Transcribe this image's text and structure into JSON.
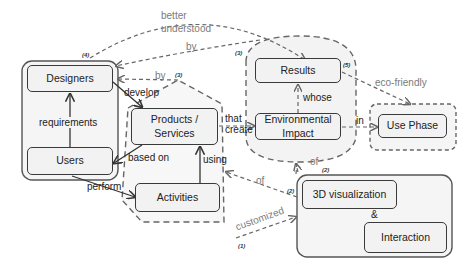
{
  "nodes": {
    "designers": "Designers",
    "users": "Users",
    "products": "Products / Services",
    "activities": "Activities",
    "results": "Results",
    "environmental_impact": "Environmental Impact",
    "use_phase": "Use Phase",
    "visualization": "3D visualization",
    "interaction": "Interaction",
    "ampersand": "&"
  },
  "edges": {
    "requirements": "requirements",
    "develop": "develop",
    "based_on": "based on",
    "perform": "perform",
    "using": "using",
    "that": "that",
    "create": "create",
    "whose": "whose",
    "in": "in",
    "eco_friendly": "eco-friendly",
    "better": "better",
    "understood": "understood",
    "by_top": "by",
    "by_mid": "by",
    "of_left": "of",
    "of_right": "of",
    "customized": "customized"
  },
  "markers": {
    "m1": "(1)",
    "m2a": "(2)",
    "m2b": "(2)",
    "m3a": "(3)",
    "m3b": "(3)",
    "m4": "(4)",
    "m5": "(5)"
  },
  "colors": {
    "line": "#3a3a3a",
    "dashed": "#666666",
    "node_fill": "#f2f2f2",
    "group_fill": "#f5f5f5"
  }
}
